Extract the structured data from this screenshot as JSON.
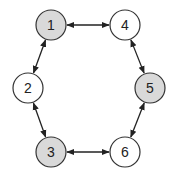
{
  "diagram": {
    "type": "graph",
    "layout": "hexagonal cycle",
    "colors": {
      "highlighted_fill": "#d9d9d9",
      "normal_fill": "#ffffff",
      "stroke": "#333333",
      "edge": "#222222"
    },
    "nodes": [
      {
        "id": "1",
        "label": "1",
        "cx": 51,
        "cy": 25,
        "highlighted": true
      },
      {
        "id": "4",
        "label": "4",
        "cx": 125,
        "cy": 25,
        "highlighted": false
      },
      {
        "id": "2",
        "label": "2",
        "cx": 28,
        "cy": 88,
        "highlighted": false
      },
      {
        "id": "5",
        "label": "5",
        "cx": 150,
        "cy": 88,
        "highlighted": true
      },
      {
        "id": "3",
        "label": "3",
        "cx": 51,
        "cy": 152,
        "highlighted": true
      },
      {
        "id": "6",
        "label": "6",
        "cx": 125,
        "cy": 152,
        "highlighted": false
      }
    ],
    "edges": [
      {
        "from": "1",
        "to": "4",
        "direction": "both"
      },
      {
        "from": "1",
        "to": "2",
        "direction": "both"
      },
      {
        "from": "2",
        "to": "3",
        "direction": "both"
      },
      {
        "from": "3",
        "to": "6",
        "direction": "both"
      },
      {
        "from": "6",
        "to": "5",
        "direction": "both"
      },
      {
        "from": "5",
        "to": "4",
        "direction": "both"
      }
    ]
  }
}
